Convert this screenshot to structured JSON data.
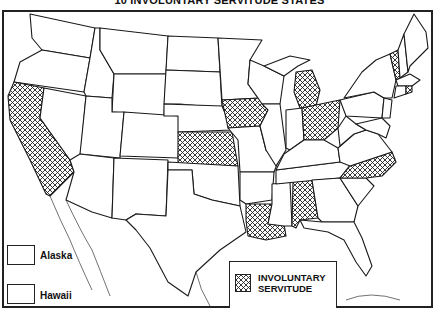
{
  "title": "10 INVOLUNTARY SERVITUDE STATES",
  "map": {
    "region": "Contiguous United States",
    "highlighted_states": [
      "California",
      "Kansas",
      "Iowa",
      "Michigan",
      "Ohio",
      "Vermont",
      "Rhode Island",
      "North Carolina",
      "Alabama",
      "Louisiana"
    ],
    "fill_pattern": "cross-hatch",
    "colors": {
      "outline": "#1a1a1a",
      "background": "#ffffff",
      "hatch": "#222222"
    }
  },
  "insets": [
    {
      "label": "Alaska",
      "highlighted": false
    },
    {
      "label": "Hawaii",
      "highlighted": false
    }
  ],
  "legend": {
    "line1": "INVOLUNTARY",
    "line2": "SERVITUDE"
  }
}
